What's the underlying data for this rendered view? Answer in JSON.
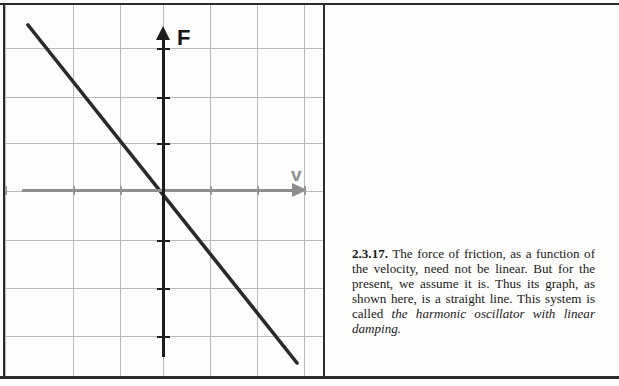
{
  "figure": {
    "axes": {
      "y_label": "F",
      "y_label_name": "force-axis-label",
      "x_label": "v",
      "x_label_name": "velocity-axis-label",
      "y_axis_color": "#1d1d1d",
      "x_axis_color": "#8e8e8e"
    },
    "grid": {
      "color": "#b9b9b9",
      "vertical_positions": [
        0,
        68,
        115,
        158,
        205,
        252,
        299
      ],
      "horizontal_positions": [
        43,
        92,
        138,
        186,
        235,
        283,
        331
      ]
    }
  },
  "chart_data": {
    "type": "line",
    "title": "",
    "xlabel": "v",
    "ylabel": "F",
    "grid": true,
    "legend": null,
    "axis_origin_px": [
      158,
      186
    ],
    "series": [
      {
        "name": "friction force",
        "color": "#2a2a2a",
        "points_px": [
          [
            23,
            20
          ],
          [
            292,
            358
          ]
        ],
        "x": [
          -3.0,
          3.0
        ],
        "y": [
          3.7,
          -3.8
        ],
        "slope": -1.25
      }
    ],
    "xlim": [
      -3.5,
      3.5
    ],
    "ylim": [
      -4.1,
      3.7
    ]
  },
  "caption": {
    "number": "2.3.17.",
    "body_before_italic": "  The force of friction, as a function of the velocity, need not be linear. But for the present, we assume it is. Thus its graph, as shown here, is a straight line.  This system is called ",
    "italic_phrase": "the harmonic oscillator with linear damping."
  }
}
